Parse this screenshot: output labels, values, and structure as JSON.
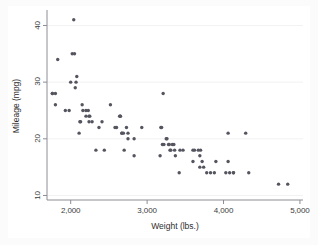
{
  "chart_data": {
    "type": "scatter",
    "title": "",
    "xlabel": "Weight (lbs.)",
    "ylabel": "Mileage (mpg)",
    "xlim": [
      1690,
      5040
    ],
    "ylim": [
      9.2,
      42.2
    ],
    "xticks": [
      2000,
      3000,
      4000,
      5000
    ],
    "xtick_labels": [
      "2,000",
      "3,000",
      "4,000",
      "5,000"
    ],
    "yticks": [
      10,
      20,
      30,
      40
    ],
    "ytick_labels": [
      "10",
      "20",
      "30",
      "40"
    ],
    "grid": "horizontal-light",
    "legend": "none",
    "marker": {
      "shape": "circle",
      "color": "#555560",
      "size_px": 3.4
    },
    "series": [
      {
        "name": "Mileage vs Weight",
        "x": [
          1760,
          1760,
          1800,
          1800,
          1830,
          1930,
          1980,
          2000,
          2020,
          2040,
          2050,
          2060,
          2070,
          2080,
          2110,
          2120,
          2130,
          2150,
          2160,
          2200,
          2200,
          2230,
          2240,
          2240,
          2250,
          2280,
          2330,
          2370,
          2410,
          2440,
          2520,
          2580,
          2600,
          2640,
          2650,
          2650,
          2670,
          2670,
          2690,
          2700,
          2730,
          2750,
          2750,
          2830,
          2830,
          2930,
          3170,
          3180,
          3190,
          3200,
          3210,
          3220,
          3250,
          3260,
          3280,
          3290,
          3300,
          3310,
          3330,
          3350,
          3360,
          3370,
          3420,
          3430,
          3470,
          3600,
          3600,
          3620,
          3670,
          3690,
          3690,
          3700,
          3720,
          3740,
          3780,
          3830,
          3880,
          3900,
          4030,
          4060,
          4060,
          4080,
          4130,
          4130,
          4290,
          4330,
          4720,
          4840
        ],
        "y": [
          28,
          28,
          28,
          26,
          34,
          25,
          25,
          30,
          35,
          41,
          35,
          29,
          30,
          31,
          21,
          23,
          23,
          26,
          25,
          25,
          24,
          25,
          24,
          23,
          24,
          23,
          18,
          22,
          23,
          18,
          26,
          22,
          22,
          24,
          24,
          24,
          21,
          21,
          21,
          18,
          22,
          21,
          20,
          20,
          17,
          22,
          17,
          22,
          22,
          19,
          28,
          19,
          20,
          20,
          19,
          19,
          18,
          18,
          19,
          19,
          18,
          17,
          14,
          18,
          18,
          16,
          18,
          18,
          18,
          17,
          15,
          18,
          16,
          15,
          14,
          14,
          14,
          16,
          14,
          21,
          16,
          14,
          14,
          14,
          21,
          14,
          12,
          12
        ]
      }
    ]
  },
  "axes": {
    "x_title": "Weight (lbs.)",
    "y_title": "Mileage (mpg)",
    "x_tick_labels": [
      "2,000",
      "3,000",
      "4,000",
      "5,000"
    ],
    "y_tick_labels": [
      "10",
      "20",
      "30",
      "40"
    ]
  },
  "colors": {
    "marker": "#555560",
    "axis_line": "#8d8d96",
    "grid_line": "#f2f2f2",
    "canvas_background": "#ffffff",
    "outer_background": "#fbfbfb",
    "text": "#3c3c3c"
  }
}
